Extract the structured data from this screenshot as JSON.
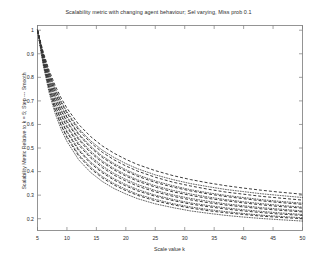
{
  "figure": {
    "width": 317,
    "height": 265,
    "background": "#ffffff",
    "axes_color": "#7a7a7a",
    "text_color": "#2b2b2b",
    "curve_color": "#333333"
  },
  "chart_data": {
    "type": "line",
    "title": "Scalability metric with changing agent behaviour; Sel varying, Miss prob 0.1",
    "xlabel": "Scale value k",
    "ylabel": "Scalability Metric Relative to k = 5; Step --- Smooth",
    "xlim": [
      5,
      50
    ],
    "ylim": [
      0.15,
      1.02
    ],
    "xticks": [
      5,
      10,
      15,
      20,
      25,
      30,
      35,
      40,
      45,
      50
    ],
    "xticklabels": [
      "5",
      "10",
      "15",
      "20",
      "25",
      "30",
      "35",
      "40",
      "45",
      "50"
    ],
    "yticks": [
      0.2,
      0.3,
      0.4,
      0.5,
      0.6,
      0.7,
      0.8,
      0.9,
      1.0
    ],
    "yticklabels": [
      "0.2",
      "0.3",
      "0.4",
      "0.5",
      "0.6",
      "0.7",
      "0.8",
      "0.9",
      "1"
    ],
    "grid": false,
    "legend": null,
    "legend_position": "none",
    "x": [
      5,
      6,
      7,
      8,
      9,
      10,
      12,
      14,
      16,
      18,
      20,
      22,
      25,
      28,
      31,
      34,
      37,
      40,
      43,
      46,
      50
    ],
    "series": [
      {
        "name": "Sel 1 (step)",
        "style": "dashed",
        "values": [
          1.0,
          0.905,
          0.828,
          0.765,
          0.713,
          0.669,
          0.6,
          0.549,
          0.509,
          0.478,
          0.452,
          0.43,
          0.404,
          0.383,
          0.366,
          0.352,
          0.34,
          0.33,
          0.321,
          0.313,
          0.304
        ]
      },
      {
        "name": "Sel 1 (smooth)",
        "style": "dotted",
        "values": [
          1.0,
          0.898,
          0.818,
          0.752,
          0.699,
          0.654,
          0.583,
          0.531,
          0.491,
          0.46,
          0.434,
          0.412,
          0.386,
          0.366,
          0.349,
          0.336,
          0.324,
          0.315,
          0.306,
          0.299,
          0.29
        ]
      },
      {
        "name": "Sel 2 (step)",
        "style": "dashed",
        "values": [
          1.0,
          0.898,
          0.816,
          0.749,
          0.694,
          0.648,
          0.576,
          0.523,
          0.482,
          0.45,
          0.424,
          0.402,
          0.376,
          0.355,
          0.339,
          0.325,
          0.313,
          0.304,
          0.295,
          0.288,
          0.279
        ]
      },
      {
        "name": "Sel 2 (smooth)",
        "style": "dotted",
        "values": [
          1.0,
          0.891,
          0.806,
          0.737,
          0.681,
          0.634,
          0.561,
          0.508,
          0.466,
          0.434,
          0.408,
          0.386,
          0.36,
          0.34,
          0.323,
          0.31,
          0.299,
          0.29,
          0.281,
          0.274,
          0.266
        ]
      },
      {
        "name": "Sel 3 (step)",
        "style": "dashed",
        "values": [
          1.0,
          0.89,
          0.804,
          0.734,
          0.677,
          0.63,
          0.556,
          0.502,
          0.46,
          0.428,
          0.402,
          0.38,
          0.354,
          0.334,
          0.318,
          0.305,
          0.294,
          0.285,
          0.276,
          0.269,
          0.261
        ]
      },
      {
        "name": "Sel 3 (smooth)",
        "style": "dotted",
        "values": [
          1.0,
          0.883,
          0.793,
          0.721,
          0.663,
          0.615,
          0.541,
          0.487,
          0.445,
          0.413,
          0.387,
          0.365,
          0.34,
          0.32,
          0.305,
          0.292,
          0.281,
          0.272,
          0.264,
          0.257,
          0.249
        ]
      },
      {
        "name": "Sel 4 (step)",
        "style": "dashed",
        "values": [
          1.0,
          0.882,
          0.79,
          0.717,
          0.658,
          0.61,
          0.535,
          0.48,
          0.439,
          0.407,
          0.381,
          0.359,
          0.334,
          0.314,
          0.299,
          0.286,
          0.276,
          0.267,
          0.259,
          0.252,
          0.245
        ]
      },
      {
        "name": "Sel 4 (smooth)",
        "style": "dotted",
        "values": [
          1.0,
          0.875,
          0.779,
          0.704,
          0.644,
          0.595,
          0.519,
          0.465,
          0.424,
          0.392,
          0.367,
          0.345,
          0.32,
          0.301,
          0.286,
          0.274,
          0.263,
          0.255,
          0.247,
          0.241,
          0.233
        ]
      },
      {
        "name": "Sel 5 (step)",
        "style": "dashed",
        "values": [
          1.0,
          0.874,
          0.776,
          0.699,
          0.638,
          0.589,
          0.512,
          0.458,
          0.417,
          0.385,
          0.36,
          0.338,
          0.314,
          0.295,
          0.28,
          0.268,
          0.258,
          0.25,
          0.242,
          0.236,
          0.229
        ]
      },
      {
        "name": "Sel 5 (smooth)",
        "style": "dotted",
        "values": [
          1.0,
          0.866,
          0.763,
          0.684,
          0.622,
          0.572,
          0.495,
          0.441,
          0.401,
          0.37,
          0.345,
          0.324,
          0.3,
          0.282,
          0.267,
          0.256,
          0.246,
          0.238,
          0.231,
          0.225,
          0.218
        ]
      },
      {
        "name": "Sel 6 (step)",
        "style": "dashed",
        "values": [
          1.0,
          0.865,
          0.761,
          0.68,
          0.617,
          0.566,
          0.489,
          0.435,
          0.395,
          0.364,
          0.339,
          0.318,
          0.295,
          0.277,
          0.262,
          0.251,
          0.241,
          0.233,
          0.226,
          0.22,
          0.214
        ]
      },
      {
        "name": "Sel 6 (smooth)",
        "style": "dotted",
        "values": [
          1.0,
          0.857,
          0.748,
          0.665,
          0.601,
          0.55,
          0.472,
          0.419,
          0.379,
          0.349,
          0.325,
          0.304,
          0.282,
          0.264,
          0.25,
          0.239,
          0.23,
          0.222,
          0.215,
          0.21,
          0.204
        ]
      },
      {
        "name": "Sel 7 (step)",
        "style": "dashed",
        "values": [
          1.0,
          0.856,
          0.745,
          0.661,
          0.596,
          0.544,
          0.466,
          0.413,
          0.373,
          0.343,
          0.319,
          0.299,
          0.276,
          0.259,
          0.245,
          0.234,
          0.225,
          0.218,
          0.211,
          0.206,
          0.2
        ]
      },
      {
        "name": "Sel 7 (smooth)",
        "style": "dotted",
        "values": [
          1.0,
          0.848,
          0.732,
          0.646,
          0.58,
          0.528,
          0.45,
          0.397,
          0.358,
          0.328,
          0.305,
          0.285,
          0.263,
          0.247,
          0.233,
          0.223,
          0.214,
          0.207,
          0.201,
          0.196,
          0.19
        ]
      }
    ]
  }
}
